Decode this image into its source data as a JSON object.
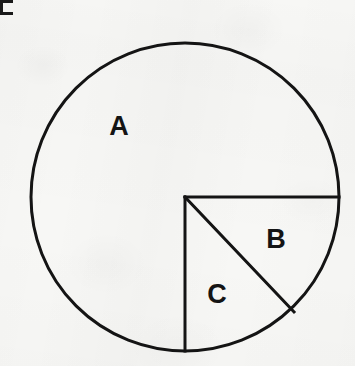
{
  "figure": {
    "background_color": "#f7f7f5",
    "stroke_color": "#141414",
    "corner_mark": {
      "name": "scan-corner-bracket",
      "color": "#191919"
    },
    "circle": {
      "center_x": 185,
      "center_y": 197,
      "radius": 154,
      "stroke_width": 3
    },
    "lines": [
      {
        "name": "horizontal-radius",
        "from_x": 185,
        "from_y": 197,
        "to_x": 339,
        "to_y": 197,
        "stroke_width": 3
      },
      {
        "name": "vertical-radius",
        "from_x": 185,
        "from_y": 197,
        "to_x": 185,
        "to_y": 351,
        "stroke_width": 3
      },
      {
        "name": "diagonal-chord",
        "from_x": 185,
        "from_y": 197,
        "to_x": 294,
        "to_y": 312,
        "stroke_width": 3
      }
    ],
    "labels": [
      {
        "text": "A",
        "x": 119,
        "y": 126,
        "font_size": 27
      },
      {
        "text": "B",
        "x": 276,
        "y": 239,
        "font_size": 27
      },
      {
        "text": "C",
        "x": 217,
        "y": 294,
        "font_size": 27
      }
    ]
  }
}
